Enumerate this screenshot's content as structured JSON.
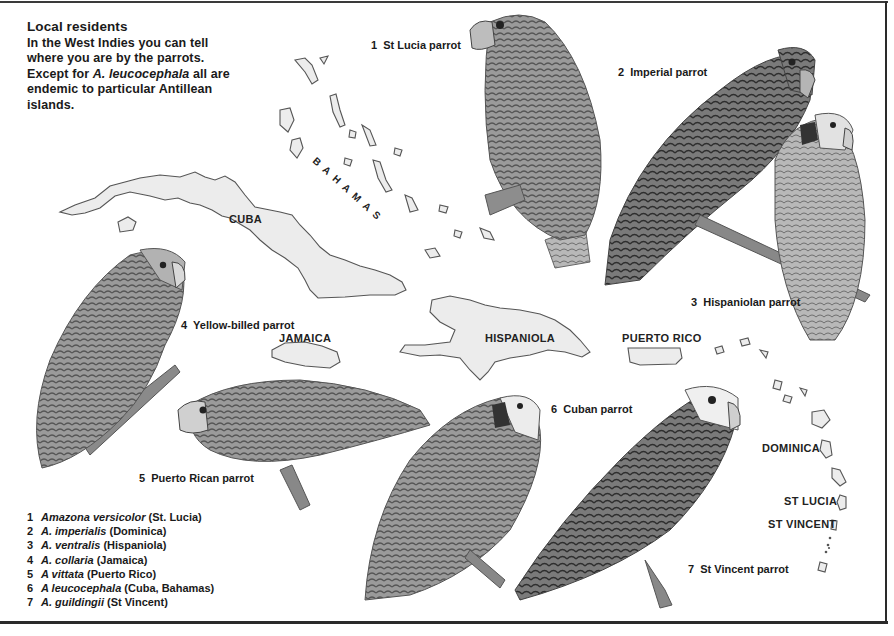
{
  "intro": {
    "title": "Local residents",
    "body_part1": "In the West Indies you can tell where you are by the parrots. Except for ",
    "body_italic": "A. leucocephala",
    "body_part2": " all are endemic to particular Antillean islands."
  },
  "parrot_labels": [
    {
      "num": "1",
      "name": "St Lucia parrot"
    },
    {
      "num": "2",
      "name": "Imperial parrot"
    },
    {
      "num": "3",
      "name": "Hispaniolan parrot"
    },
    {
      "num": "4",
      "name": "Yellow-billed parrot"
    },
    {
      "num": "5",
      "name": "Puerto Rican parrot"
    },
    {
      "num": "6",
      "name": "Cuban parrot"
    },
    {
      "num": "7",
      "name": "St Vincent parrot"
    }
  ],
  "places": {
    "bahamas": "BAHAMAS",
    "cuba": "CUBA",
    "jamaica": "JAMAICA",
    "hispaniola": "HISPANIOLA",
    "puerto_rico": "PUERTO RICO",
    "dominica": "DOMINICA",
    "st_lucia": "ST LUCIA",
    "st_vincent": "ST VINCENT"
  },
  "legend": [
    {
      "num": "1",
      "species": "Amazona versicolor",
      "island": "(St. Lucia)"
    },
    {
      "num": "2",
      "species": "A. imperialis",
      "island": "(Dominica)"
    },
    {
      "num": "3",
      "species": "A. ventralis",
      "island": "(Hispaniola)"
    },
    {
      "num": "4",
      "species": "A. collaria",
      "island": "(Jamaica)"
    },
    {
      "num": "5",
      "species": "A vittata",
      "island": "(Puerto Rico)"
    },
    {
      "num": "6",
      "species": "A leucocephala",
      "island": "(Cuba, Bahamas)"
    },
    {
      "num": "7",
      "species": "A. guildingii",
      "island": "(St Vincent)"
    }
  ],
  "colors": {
    "ink": "#1a1a1a",
    "island_fill": "#ececec",
    "island_stroke": "#555555",
    "feather_dark": "#4a4a4a",
    "feather_mid": "#8a8a8a",
    "feather_light": "#c8c8c8"
  }
}
